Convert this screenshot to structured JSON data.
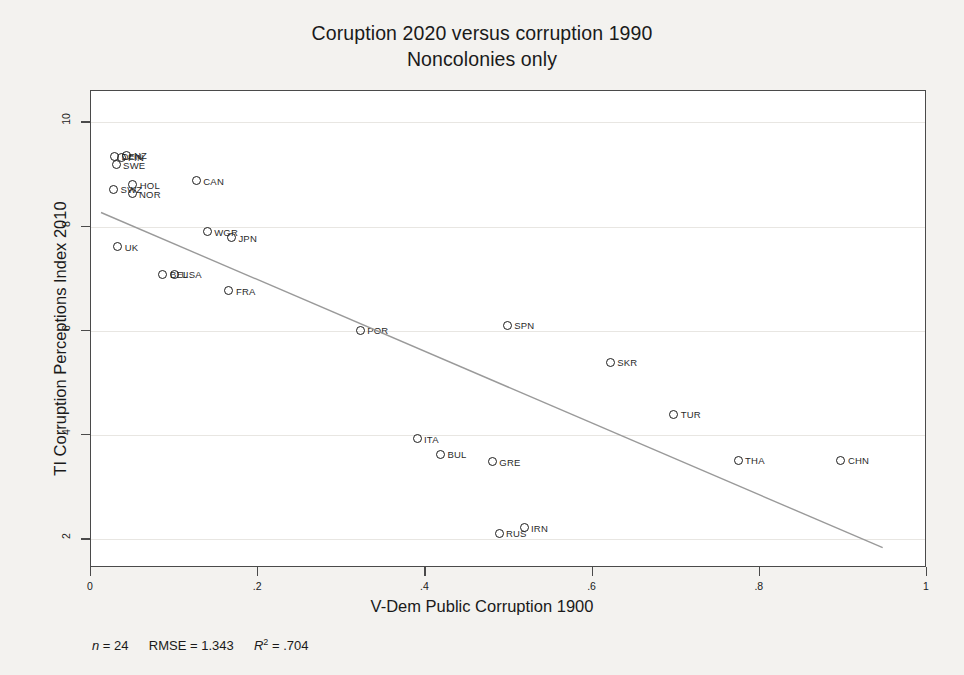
{
  "chart_data": {
    "type": "scatter",
    "title": "Coruption 2020 versus corruption 1990",
    "subtitle": "Noncolonies only",
    "xlabel": "V-Dem Public Corruption 1900",
    "ylabel": "TI Corruption Perceptions Index 2010",
    "xlim": [
      0,
      1
    ],
    "ylim": [
      1.45,
      10.6
    ],
    "xticks": [
      "0",
      ".2",
      ".4",
      ".6",
      ".8",
      "1"
    ],
    "xtick_values": [
      0,
      0.2,
      0.4,
      0.6,
      0.8,
      1
    ],
    "yticks": [
      "2",
      "4",
      "6",
      "8",
      "10"
    ],
    "ytick_values": [
      2,
      4,
      6,
      8,
      10
    ],
    "grid": true,
    "legend": "none",
    "points": [
      {
        "label": "DEN",
        "x": 0.028,
        "y": 9.35
      },
      {
        "label": "FIN",
        "x": 0.036,
        "y": 9.33
      },
      {
        "label": "NZ",
        "x": 0.043,
        "y": 9.37
      },
      {
        "label": "SWE",
        "x": 0.03,
        "y": 9.19
      },
      {
        "label": "HOL",
        "x": 0.05,
        "y": 8.8
      },
      {
        "label": "SWZ",
        "x": 0.027,
        "y": 8.72
      },
      {
        "label": "NOR",
        "x": 0.049,
        "y": 8.63
      },
      {
        "label": "CAN",
        "x": 0.126,
        "y": 8.88
      },
      {
        "label": "WGR",
        "x": 0.139,
        "y": 7.9
      },
      {
        "label": "JPN",
        "x": 0.168,
        "y": 7.79
      },
      {
        "label": "UK",
        "x": 0.032,
        "y": 7.61
      },
      {
        "label": "BEL",
        "x": 0.086,
        "y": 7.09
      },
      {
        "label": "USA",
        "x": 0.1,
        "y": 7.09
      },
      {
        "label": "FRA",
        "x": 0.165,
        "y": 6.77
      },
      {
        "label": "POR",
        "x": 0.322,
        "y": 6.01
      },
      {
        "label": "SPN",
        "x": 0.498,
        "y": 6.11
      },
      {
        "label": "SKR",
        "x": 0.621,
        "y": 5.4
      },
      {
        "label": "TUR",
        "x": 0.697,
        "y": 4.4
      },
      {
        "label": "ITA",
        "x": 0.39,
        "y": 3.93
      },
      {
        "label": "BUL",
        "x": 0.418,
        "y": 3.63
      },
      {
        "label": "GRE",
        "x": 0.48,
        "y": 3.49
      },
      {
        "label": "THA",
        "x": 0.774,
        "y": 3.52
      },
      {
        "label": "CHN",
        "x": 0.897,
        "y": 3.52
      },
      {
        "label": "RUS",
        "x": 0.488,
        "y": 2.12
      },
      {
        "label": "IRN",
        "x": 0.518,
        "y": 2.22
      }
    ],
    "fit_line": {
      "x1": 0.012,
      "y1": 8.27,
      "x2": 0.947,
      "y2": 1.84
    },
    "stats": {
      "n_label": "n",
      "n_value": "= 24",
      "rmse_label": "RMSE =",
      "rmse_value": "1.343",
      "r2_label": "R",
      "r2_exp": "2",
      "r2_value": "= .704"
    }
  }
}
